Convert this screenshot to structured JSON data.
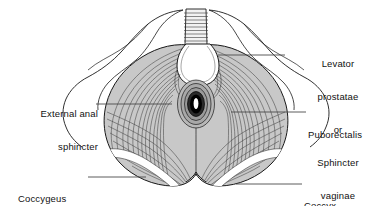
{
  "figure": {
    "background_color": "#ffffff",
    "outline_color": "#1a1a1a",
    "muscle_fill_color": "#c9c9c9",
    "striation_color": "#3a3a3a",
    "sphincter_ring_color": "#000000",
    "width": 392,
    "height": 206
  },
  "labels": {
    "levator_prostatae": {
      "line1": "Levator",
      "line2": "prostatae",
      "line3": "or",
      "line4": "Sphincter",
      "line5": "vaginae"
    },
    "external_anal_sphincter": {
      "line1": "External anal",
      "line2": "sphincter"
    },
    "puborectalis": {
      "line1": "Puborectalis"
    },
    "coccygeus": {
      "line1": "Coccygeus"
    },
    "coccyx": {
      "line1": "Coccyx"
    }
  },
  "leader_lines": [
    {
      "name": "levator-prostatae-leader",
      "x1": 218,
      "y1": 55,
      "x2": 285,
      "y2": 55
    },
    {
      "name": "external-anal-sphincter-leader",
      "x1": 96,
      "y1": 104,
      "x2": 172,
      "y2": 104
    },
    {
      "name": "puborectalis-leader",
      "x1": 231,
      "y1": 112,
      "x2": 306,
      "y2": 112
    },
    {
      "name": "coccygeus-leader",
      "x1": 88,
      "y1": 177,
      "x2": 146,
      "y2": 177
    },
    {
      "name": "coccyx-leader",
      "x1": 236,
      "y1": 184,
      "x2": 302,
      "y2": 184
    }
  ],
  "anatomy_parts": [
    "pubic-ramus-left",
    "pubic-ramus-right",
    "perineal-membrane-hatching",
    "urogenital-hiatus",
    "levator-ani-sheet",
    "anal-sphincter-rings",
    "coccygeus-band-left",
    "coccygeus-band-right",
    "coccyx-notch"
  ]
}
